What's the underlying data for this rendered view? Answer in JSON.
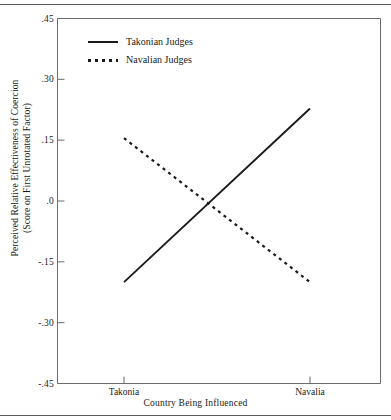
{
  "chart_data": {
    "type": "line",
    "title": "",
    "xlabel": "Country Being Influenced",
    "ylabel_line1": "Perceived Relative Effectiveness of Coercion",
    "ylabel_line2": "(Score on First Unrotated Factor)",
    "categories": [
      "Takonia",
      "Navalia"
    ],
    "xtick_labels": [
      "Takonia",
      "Navalia"
    ],
    "ytick_labels": [
      ".45",
      ".30",
      ".15",
      ".0",
      "-.15",
      "-.30",
      "-.45"
    ],
    "ytick_values": [
      0.45,
      0.3,
      0.15,
      0.0,
      -0.15,
      -0.3,
      -0.45
    ],
    "ylim": [
      -0.45,
      0.45
    ],
    "grid": false,
    "legend_position": "upper-left-inside",
    "series": [
      {
        "name": "Takonian Judges",
        "style": "solid",
        "color": "#1a1a1a",
        "values": [
          -0.2,
          0.228
        ]
      },
      {
        "name": "Navalian Judges",
        "style": "dotted",
        "color": "#1a1a1a",
        "values": [
          0.155,
          -0.2
        ]
      }
    ]
  },
  "legend": {
    "items": [
      {
        "label": "Takonian Judges",
        "style": "solid"
      },
      {
        "label": "Navalian Judges",
        "style": "dotted"
      }
    ]
  },
  "axes": {
    "x_title": "Country Being Influenced",
    "y_title_line1": "Perceived Relative Effectiveness of Coercion",
    "y_title_line2": "(Score on First Unrotated Factor)"
  },
  "colors": {
    "line": "#1a1a1a",
    "axis": "#6b6b6b",
    "rule": "#5a5a5a",
    "background": "#ffffff"
  }
}
